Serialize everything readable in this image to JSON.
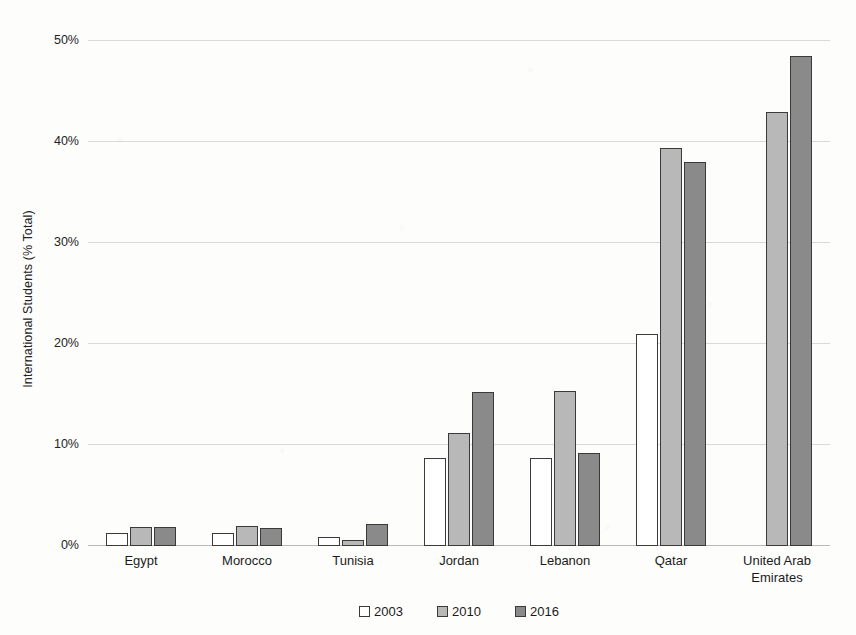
{
  "chart_data": {
    "type": "bar",
    "title": "",
    "xlabel": "",
    "ylabel": "International Students (% Total)",
    "ylim": [
      0,
      50
    ],
    "ytick_labels": [
      "0%",
      "10%",
      "20%",
      "30%",
      "40%",
      "50%"
    ],
    "ytick_values": [
      0,
      10,
      20,
      30,
      40,
      50
    ],
    "grid": true,
    "legend_position": "bottom",
    "categories": [
      "Egypt",
      "Morocco",
      "Tunisia",
      "Jordan",
      "Lebanon",
      "Qatar",
      "United Arab Emirates"
    ],
    "series": [
      {
        "name": "2003",
        "color": "#ffffff",
        "values": [
          1.3,
          1.3,
          0.9,
          8.7,
          8.7,
          21.0,
          null
        ]
      },
      {
        "name": "2010",
        "color": "#b8b8b8",
        "values": [
          1.9,
          2.0,
          0.6,
          11.2,
          15.3,
          39.4,
          43.0
        ]
      },
      {
        "name": "2016",
        "color": "#8a8a8a",
        "values": [
          1.9,
          1.8,
          2.2,
          15.2,
          9.2,
          38.0,
          48.5
        ]
      }
    ]
  },
  "axis": {
    "y_title": "International Students (% Total)"
  },
  "legend": {
    "items": [
      {
        "label": "2003"
      },
      {
        "label": "2010"
      },
      {
        "label": "2016"
      }
    ]
  },
  "colors": {
    "series_2003": "#ffffff",
    "series_2010": "#b8b8b8",
    "series_2016": "#8a8a8a",
    "bar_outline": "#3a3a3a",
    "gridline": "#d9d9d9",
    "text": "#1b1b1b",
    "background": "#fdfdfc"
  }
}
